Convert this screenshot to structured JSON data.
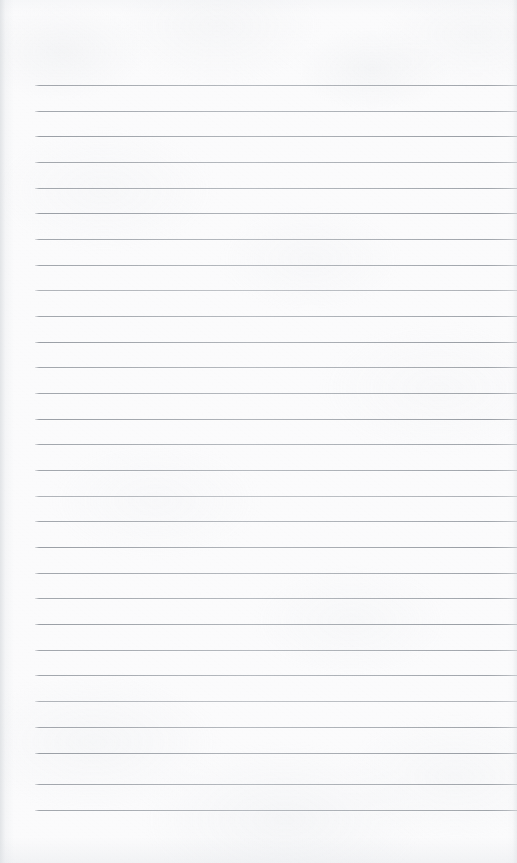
{
  "document": {
    "kind": "scanned-lined-notepad-page",
    "title": "Blank Lined Notepad Page",
    "content_text": "",
    "is_blank": true,
    "page_width_px": 517,
    "page_height_px": 863
  },
  "colors": {
    "paper": "#fbfbfc",
    "rule_line": "#969ba2",
    "edge_shadow": "#d0d4d8",
    "background": "#ffffff"
  },
  "ruling": {
    "line_count": 29,
    "first_line_y_px": 85,
    "line_spacing_px": 25.7,
    "line_thickness_px": 1,
    "left_margin_px": 35,
    "right_margin_px": 0,
    "bottom_margin_px": 53,
    "style": "wide-ruled"
  },
  "rule_lines": [
    {
      "index": 1,
      "y": 85,
      "weight": "normal"
    },
    {
      "index": 2,
      "y": 111,
      "weight": "normal"
    },
    {
      "index": 3,
      "y": 136,
      "weight": "strong"
    },
    {
      "index": 4,
      "y": 162,
      "weight": "normal"
    },
    {
      "index": 5,
      "y": 188,
      "weight": "normal"
    },
    {
      "index": 6,
      "y": 213,
      "weight": "strong"
    },
    {
      "index": 7,
      "y": 239,
      "weight": "normal"
    },
    {
      "index": 8,
      "y": 265,
      "weight": "normal"
    },
    {
      "index": 9,
      "y": 290,
      "weight": "faint"
    },
    {
      "index": 10,
      "y": 316,
      "weight": "normal"
    },
    {
      "index": 11,
      "y": 342,
      "weight": "strong"
    },
    {
      "index": 12,
      "y": 367,
      "weight": "normal"
    },
    {
      "index": 13,
      "y": 393,
      "weight": "normal"
    },
    {
      "index": 14,
      "y": 419,
      "weight": "strong"
    },
    {
      "index": 15,
      "y": 444,
      "weight": "normal"
    },
    {
      "index": 16,
      "y": 470,
      "weight": "normal"
    },
    {
      "index": 17,
      "y": 496,
      "weight": "faint"
    },
    {
      "index": 18,
      "y": 521,
      "weight": "normal"
    },
    {
      "index": 19,
      "y": 547,
      "weight": "strong"
    },
    {
      "index": 20,
      "y": 573,
      "weight": "normal"
    },
    {
      "index": 21,
      "y": 598,
      "weight": "normal"
    },
    {
      "index": 22,
      "y": 624,
      "weight": "strong"
    },
    {
      "index": 23,
      "y": 650,
      "weight": "normal"
    },
    {
      "index": 24,
      "y": 675,
      "weight": "normal"
    },
    {
      "index": 25,
      "y": 701,
      "weight": "faint"
    },
    {
      "index": 26,
      "y": 727,
      "weight": "normal"
    },
    {
      "index": 27,
      "y": 753,
      "weight": "strong"
    },
    {
      "index": 28,
      "y": 784,
      "weight": "normal"
    },
    {
      "index": 29,
      "y": 810,
      "weight": "normal"
    }
  ]
}
